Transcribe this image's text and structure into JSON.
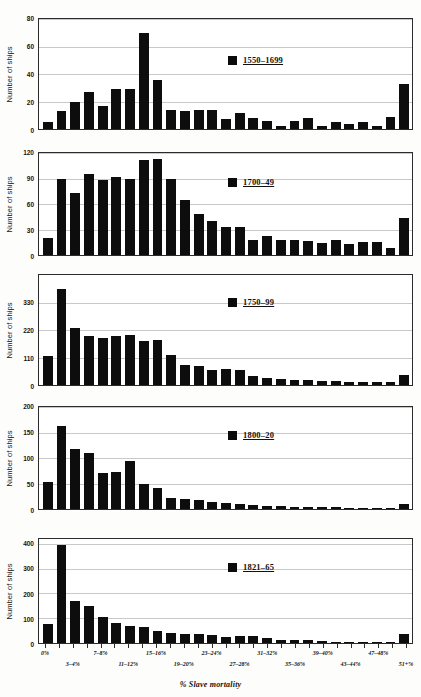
{
  "figure": {
    "xlabel": "% Slave mortality",
    "ylabel": "Number of ships"
  },
  "chart_data": [
    {
      "type": "bar",
      "title": "1550–1699",
      "legend_label": "1550–1699",
      "xlabel": "% Slave mortality",
      "ylabel": "Number of ships",
      "ylim": [
        0,
        80
      ],
      "yticks": [
        0,
        20,
        40,
        60,
        80
      ],
      "grid": true,
      "legend_position": "center",
      "categories": [
        "0%",
        "1–2%",
        "3–4%",
        "5–6%",
        "7–8%",
        "9–10%",
        "11–12%",
        "13–14%",
        "15–16%",
        "17–18%",
        "19–20%",
        "21–22%",
        "23–24%",
        "25–26%",
        "27–28%",
        "29–30%",
        "31–32%",
        "33–34%",
        "35–36%",
        "37–38%",
        "39–40%",
        "41–42%",
        "43–44%",
        "45–46%",
        "47–48%",
        "49–50%",
        "51+%"
      ],
      "values": [
        5,
        13,
        20,
        27,
        17,
        29,
        29,
        70,
        36,
        14,
        13,
        14,
        14,
        7,
        12,
        8,
        6,
        2,
        6,
        8,
        2,
        5,
        4,
        5,
        2,
        9,
        33
      ]
    },
    {
      "type": "bar",
      "title": "1700–49",
      "legend_label": "1700–49",
      "xlabel": "% Slave mortality",
      "ylabel": "Number of ships",
      "ylim": [
        0,
        120
      ],
      "yticks": [
        0,
        30,
        60,
        90,
        120
      ],
      "grid": true,
      "legend_position": "center",
      "categories": [
        "0%",
        "1–2%",
        "3–4%",
        "5–6%",
        "7–8%",
        "9–10%",
        "11–12%",
        "13–14%",
        "15–16%",
        "17–18%",
        "19–20%",
        "21–22%",
        "23–24%",
        "25–26%",
        "27–28%",
        "29–30%",
        "31–32%",
        "33–34%",
        "35–36%",
        "37–38%",
        "39–40%",
        "41–42%",
        "43–44%",
        "45–46%",
        "47–48%",
        "49–50%",
        "51+%"
      ],
      "values": [
        20,
        90,
        73,
        95,
        88,
        92,
        90,
        112,
        113,
        90,
        65,
        48,
        40,
        33,
        33,
        18,
        22,
        18,
        18,
        17,
        14,
        18,
        13,
        15,
        15,
        8,
        44
      ]
    },
    {
      "type": "bar",
      "title": "1750–99",
      "legend_label": "1750–99",
      "xlabel": "% Slave mortality",
      "ylabel": "Number of ships",
      "ylim": [
        0,
        440
      ],
      "yticks": [
        0,
        110,
        220,
        330
      ],
      "grid": true,
      "legend_position": "center",
      "categories": [
        "0%",
        "1–2%",
        "3–4%",
        "5–6%",
        "7–8%",
        "9–10%",
        "11–12%",
        "13–14%",
        "15–16%",
        "17–18%",
        "19–20%",
        "21–22%",
        "23–24%",
        "25–26%",
        "27–28%",
        "29–30%",
        "31–32%",
        "33–34%",
        "35–36%",
        "37–38%",
        "39–40%",
        "41–42%",
        "43–44%",
        "45–46%",
        "47–48%",
        "49–50%",
        "51+%"
      ],
      "values": [
        118,
        385,
        228,
        196,
        188,
        196,
        200,
        175,
        180,
        120,
        82,
        76,
        62,
        65,
        60,
        35,
        30,
        24,
        22,
        20,
        18,
        17,
        14,
        13,
        12,
        12,
        40
      ]
    },
    {
      "type": "bar",
      "title": "1800–20",
      "legend_label": "1800–20",
      "xlabel": "% Slave mortality",
      "ylabel": "Number of ships",
      "ylim": [
        0,
        200
      ],
      "yticks": [
        0,
        50,
        100,
        150,
        200
      ],
      "grid": true,
      "legend_position": "center",
      "categories": [
        "0%",
        "1–2%",
        "3–4%",
        "5–6%",
        "7–8%",
        "9–10%",
        "11–12%",
        "13–14%",
        "15–16%",
        "17–18%",
        "19–20%",
        "21–22%",
        "23–24%",
        "25–26%",
        "27–28%",
        "29–30%",
        "31–32%",
        "33–34%",
        "35–36%",
        "37–38%",
        "39–40%",
        "41–42%",
        "43–44%",
        "45–46%",
        "47–48%",
        "49–50%",
        "51+%"
      ],
      "values": [
        53,
        163,
        118,
        110,
        70,
        72,
        95,
        50,
        42,
        22,
        20,
        17,
        14,
        12,
        10,
        8,
        6,
        5,
        4,
        4,
        3,
        3,
        2,
        2,
        2,
        2,
        10
      ]
    },
    {
      "type": "bar",
      "title": "1821–65",
      "legend_label": "1821–65",
      "xlabel": "% Slave mortality",
      "ylabel": "Number of ships",
      "ylim": [
        0,
        420
      ],
      "yticks": [
        0,
        100,
        200,
        300,
        400
      ],
      "grid": true,
      "legend_position": "center",
      "categories": [
        "0%",
        "1–2%",
        "3–4%",
        "5–6%",
        "7–8%",
        "9–10%",
        "11–12%",
        "13–14%",
        "15–16%",
        "17–18%",
        "19–20%",
        "21–22%",
        "23–24%",
        "25–26%",
        "27–28%",
        "29–30%",
        "31–32%",
        "33–34%",
        "35–36%",
        "37–38%",
        "39–40%",
        "41–42%",
        "43–44%",
        "45–46%",
        "47–48%",
        "49–50%",
        "51+%"
      ],
      "values": [
        75,
        395,
        170,
        150,
        105,
        80,
        68,
        65,
        48,
        42,
        38,
        35,
        33,
        24,
        28,
        27,
        22,
        14,
        13,
        12,
        9,
        6,
        5,
        4,
        4,
        4,
        36
      ]
    }
  ],
  "xaxis": {
    "title": "% Slave mortality",
    "tick_labels": [
      {
        "index": 0,
        "label": "0%",
        "row": 0
      },
      {
        "index": 2,
        "label": "3–4%",
        "row": 1
      },
      {
        "index": 4,
        "label": "7–8%",
        "row": 0
      },
      {
        "index": 6,
        "label": "11–12%",
        "row": 1
      },
      {
        "index": 8,
        "label": "15–16%",
        "row": 0
      },
      {
        "index": 10,
        "label": "19–20%",
        "row": 1
      },
      {
        "index": 12,
        "label": "23–24%",
        "row": 0
      },
      {
        "index": 14,
        "label": "27–28%",
        "row": 1
      },
      {
        "index": 16,
        "label": "31–32%",
        "row": 0
      },
      {
        "index": 18,
        "label": "35–36%",
        "row": 1
      },
      {
        "index": 20,
        "label": "39–40%",
        "row": 0
      },
      {
        "index": 22,
        "label": "43–44%",
        "row": 1
      },
      {
        "index": 24,
        "label": "47–48%",
        "row": 0
      },
      {
        "index": 26,
        "label": "51+%",
        "row": 1
      }
    ]
  },
  "colors": {
    "bar": "#0d0d0d",
    "axis": "#2b2b2b",
    "grid": "#c9c9c9",
    "background": "#ffffff"
  }
}
